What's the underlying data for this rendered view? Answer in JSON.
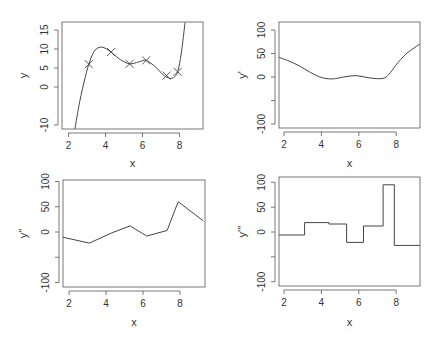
{
  "chart_data": [
    {
      "type": "line",
      "panel": "top-left",
      "title": "",
      "xlabel": "x",
      "ylabel": "y",
      "xlim": [
        1.64,
        9.26
      ],
      "ylim": [
        -11,
        17
      ],
      "xticks": [
        2,
        4,
        6,
        8
      ],
      "yticks": [
        -10,
        0,
        5,
        10,
        15
      ],
      "ytick_labels": [
        "-10",
        "",
        "0",
        "5",
        "10",
        "15"
      ],
      "grid": false,
      "points_marker": "x",
      "points": {
        "x": [
          3.1,
          4.3,
          5.3,
          6.2,
          7.3,
          7.9
        ],
        "y": [
          6,
          9.2,
          6.1,
          7,
          3,
          4
        ]
      },
      "curve": {
        "x": [
          2.35,
          2.6,
          2.9,
          3.1,
          3.4,
          3.8,
          4.3,
          4.8,
          5.3,
          5.8,
          6.2,
          6.7,
          7.1,
          7.4,
          7.65,
          7.9,
          8.1,
          8.3
        ],
        "y": [
          -11,
          -4,
          2.5,
          6,
          9.5,
          10.5,
          9.2,
          7.2,
          6.1,
          6.6,
          7,
          5.3,
          3.3,
          2.4,
          2.4,
          4,
          9,
          17
        ]
      }
    },
    {
      "type": "line",
      "panel": "top-right",
      "title": "",
      "xlabel": "x",
      "ylabel": "y'",
      "xlim": [
        1.64,
        9.26
      ],
      "ylim": [
        -110,
        110
      ],
      "xticks": [
        2,
        4,
        6,
        8
      ],
      "yticks": [
        -100,
        -50,
        0,
        50,
        100
      ],
      "ytick_labels": [
        "-100",
        "",
        "0",
        "50",
        "100"
      ],
      "grid": false,
      "curve": {
        "x": [
          1.64,
          2.2,
          2.8,
          3.4,
          4.0,
          4.6,
          5.2,
          5.8,
          6.3,
          6.8,
          7.3,
          7.6,
          8.0,
          8.5,
          9.0,
          9.26
        ],
        "y": [
          43,
          35,
          24,
          10,
          -1,
          -4,
          0,
          3,
          0,
          -3,
          -3,
          5,
          26,
          48,
          63,
          70
        ]
      }
    },
    {
      "type": "line",
      "panel": "bottom-left",
      "title": "",
      "xlabel": "x",
      "ylabel": "y''",
      "xlim": [
        1.64,
        9.26
      ],
      "ylim": [
        -110,
        110
      ],
      "xticks": [
        2,
        4,
        6,
        8
      ],
      "yticks": [
        -100,
        -50,
        0,
        50,
        100
      ],
      "ytick_labels": [
        "-100",
        "",
        "0",
        "50",
        "100"
      ],
      "grid": false,
      "curve": {
        "x": [
          1.64,
          3.1,
          4.3,
          5.3,
          6.2,
          7.3,
          7.9,
          9.26
        ],
        "y": [
          -10,
          -22,
          -2,
          12,
          -8,
          3,
          60,
          22
        ]
      }
    },
    {
      "type": "line",
      "panel": "bottom-right",
      "title": "",
      "xlabel": "x",
      "ylabel": "y'''",
      "xlim": [
        1.64,
        9.26
      ],
      "ylim": [
        -110,
        110
      ],
      "xticks": [
        2,
        4,
        6,
        8
      ],
      "yticks": [
        -100,
        -50,
        0,
        50,
        100
      ],
      "ytick_labels": [
        "-100",
        "",
        "0",
        "50",
        "100"
      ],
      "grid": false,
      "step": true,
      "curve": {
        "x": [
          1.64,
          3.1,
          3.1,
          4.4,
          4.4,
          5.35,
          5.35,
          6.25,
          6.25,
          7.3,
          7.3,
          7.9,
          7.9,
          9.26
        ],
        "y": [
          -6,
          -6,
          19,
          19,
          16,
          16,
          -21,
          -21,
          12,
          12,
          95,
          95,
          -27,
          -27
        ]
      }
    }
  ],
  "labels": {
    "x": "x",
    "y": "y",
    "y1": "y'",
    "y2": "y''",
    "y3": "y'''"
  }
}
